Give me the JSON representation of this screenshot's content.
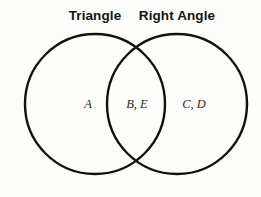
{
  "diagram": {
    "type": "venn-two-set",
    "background_color": "#fdfdfc",
    "stroke_color": "#111111",
    "title_color": "#141414",
    "label_color": "#2a2a2a",
    "sets": [
      {
        "id": "left",
        "title": "Triangle",
        "center_x": 95,
        "center_y": 104,
        "radius": 71
      },
      {
        "id": "right",
        "title": "Right Angle",
        "center_x": 177,
        "center_y": 104,
        "radius": 71
      }
    ],
    "regions": [
      {
        "id": "left-only",
        "label": "A",
        "members": [
          "A"
        ],
        "x": 88,
        "y": 104
      },
      {
        "id": "overlap",
        "label": "B, E",
        "members": [
          "B",
          "E"
        ],
        "x": 137,
        "y": 104
      },
      {
        "id": "right-only",
        "label": "C, D",
        "members": [
          "C",
          "D"
        ],
        "x": 194,
        "y": 104
      }
    ]
  }
}
